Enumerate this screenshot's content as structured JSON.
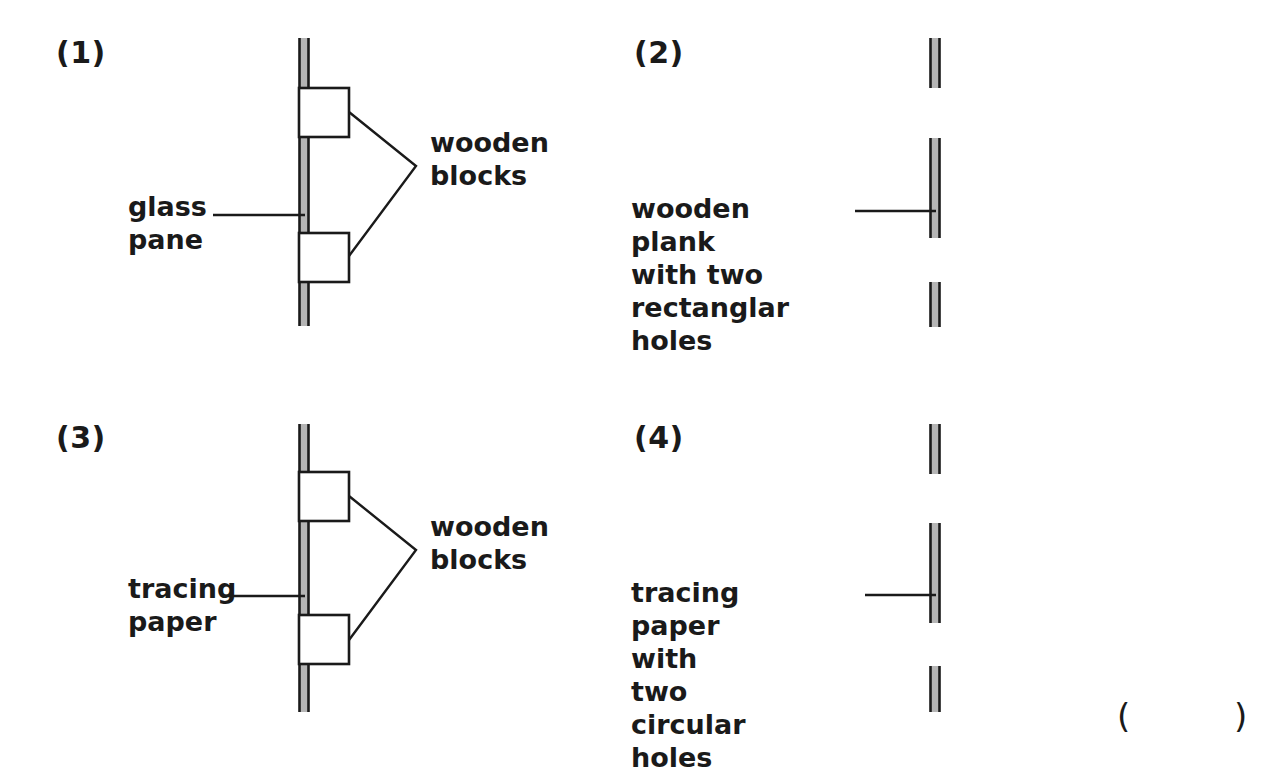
{
  "figure": {
    "background_color": "#ffffff",
    "ink_color": "#1a1a1a",
    "pane_fill_color": "#b5b5b5",
    "block_fill_color": "#ffffff",
    "trailing_marks": {
      "open_paren": "(",
      "close_paren": ")"
    }
  },
  "panels": [
    {
      "number": "(1)",
      "labels": {
        "sheet": "glass\npane",
        "blocks": "wooden\nblocks"
      },
      "sheet_type": "glass pane",
      "block_count": 2
    },
    {
      "number": "(2)",
      "labels": {
        "plank": "wooden plank\nwith two\nrectanglar holes"
      },
      "sheet_type": "wooden plank with two rectanglar holes",
      "segment_count": 3
    },
    {
      "number": "(3)",
      "labels": {
        "sheet": "tracing\npaper",
        "blocks": "wooden\nblocks"
      },
      "sheet_type": "tracing paper",
      "block_count": 2
    },
    {
      "number": "(4)",
      "labels": {
        "plank": "tracing paper\nwith two\ncircular holes"
      },
      "sheet_type": "tracing paper with two circular holes",
      "segment_count": 3
    }
  ]
}
